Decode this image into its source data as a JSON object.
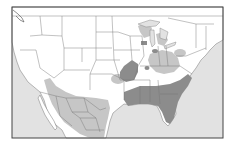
{
  "map": {
    "title": "",
    "region": "United States and Mexico",
    "colors": {
      "ocean": "#e2e2e2",
      "land": "#ffffff",
      "border": "#777777",
      "frame": "#444444",
      "range_light": "#c6c6c6",
      "range_dark": "#8c8c8c"
    },
    "legend": []
  }
}
